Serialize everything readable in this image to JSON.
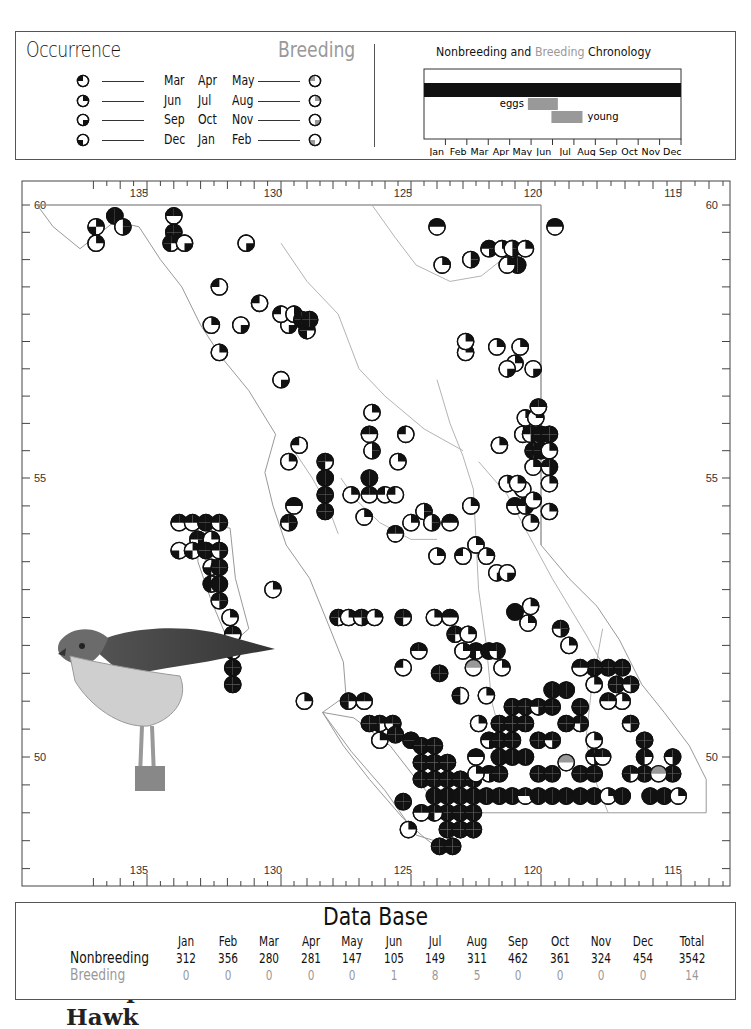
{
  "legend": {
    "occurrence_title": "Occurrence",
    "breeding_title": "Breeding",
    "seasons": [
      {
        "months": [
          "Mar",
          "Apr",
          "May"
        ],
        "quadrant": "top-left"
      },
      {
        "months": [
          "Jun",
          "Jul",
          "Aug"
        ],
        "quadrant": "top-right"
      },
      {
        "months": [
          "Sep",
          "Oct",
          "Nov"
        ],
        "quadrant": "bottom-right"
      },
      {
        "months": [
          "Dec",
          "Jan",
          "Feb"
        ],
        "quadrant": "bottom-left"
      }
    ],
    "colors": {
      "nonbreeding": "#111111",
      "breeding": "#999999"
    }
  },
  "chronology": {
    "title_a": "Nonbreeding",
    "title_and": "and",
    "title_b": "Breeding",
    "title_c": "Chronology",
    "months": [
      "Jan",
      "Feb",
      "Mar",
      "Apr",
      "May",
      "Jun",
      "Jul",
      "Aug",
      "Sep",
      "Oct",
      "Nov",
      "Dec"
    ],
    "bars": [
      {
        "label": "",
        "type": "nonbreeding",
        "start_month": 0,
        "end_month": 12
      },
      {
        "label": "eggs",
        "type": "breeding",
        "start_month": 4.85,
        "end_month": 6.25
      },
      {
        "label": "young",
        "type": "breeding",
        "start_month": 5.95,
        "end_month": 7.4
      }
    ]
  },
  "map": {
    "species_line1": "Sharp-shinned",
    "species_line2": "Hawk",
    "lon_labels": [
      "135",
      "130",
      "125",
      "120",
      "115"
    ],
    "lat_labels": [
      "60",
      "55",
      "50"
    ],
    "symbol_codes": "T=top-left(spring) R=top-right(summer) B=bottom-right(fall) L=bottom-left(winter) G=breeding gray",
    "records": [
      [
        136.2,
        59.8,
        "TRBL"
      ],
      [
        136.9,
        59.6,
        "RL"
      ],
      [
        135.9,
        59.6,
        "RB"
      ],
      [
        136.9,
        59.3,
        "R"
      ],
      [
        134.0,
        59.8,
        "TR"
      ],
      [
        134.0,
        59.5,
        "TRBL"
      ],
      [
        134.1,
        59.3,
        "TRL"
      ],
      [
        133.6,
        59.3,
        "B"
      ],
      [
        131.3,
        59.3,
        "B"
      ],
      [
        132.3,
        58.5,
        "T"
      ],
      [
        130.8,
        58.2,
        "T"
      ],
      [
        131.5,
        57.8,
        "B"
      ],
      [
        132.6,
        57.8,
        "R"
      ],
      [
        129.7,
        57.8,
        "B"
      ],
      [
        130.0,
        58.0,
        "T"
      ],
      [
        129.5,
        58.0,
        "RB"
      ],
      [
        129.2,
        57.9,
        "TRBL"
      ],
      [
        129.0,
        57.7,
        "TRL"
      ],
      [
        128.9,
        57.9,
        "TRBL"
      ],
      [
        132.3,
        57.3,
        "R"
      ],
      [
        130.0,
        56.8,
        "B"
      ],
      [
        126.5,
        56.2,
        "R"
      ],
      [
        126.6,
        55.8,
        "TR"
      ],
      [
        126.5,
        55.5,
        "RB"
      ],
      [
        125.5,
        55.3,
        "R"
      ],
      [
        125.2,
        55.8,
        "T"
      ],
      [
        129.3,
        55.6,
        "T"
      ],
      [
        129.7,
        55.3,
        "R"
      ],
      [
        128.3,
        55.3,
        "TRL"
      ],
      [
        128.3,
        55.0,
        "TRBL"
      ],
      [
        128.3,
        54.7,
        "TRBL"
      ],
      [
        128.3,
        54.4,
        "TRBL"
      ],
      [
        129.5,
        54.5,
        "TR"
      ],
      [
        129.7,
        54.2,
        "TRB"
      ],
      [
        126.6,
        55.0,
        "TRBL"
      ],
      [
        126.6,
        54.7,
        "TR"
      ],
      [
        126.0,
        54.7,
        "T"
      ],
      [
        125.6,
        54.7,
        "T"
      ],
      [
        127.3,
        54.7,
        "R"
      ],
      [
        126.8,
        54.3,
        "R"
      ],
      [
        125.0,
        54.2,
        "R"
      ],
      [
        125.6,
        54.0,
        "TR"
      ],
      [
        133.8,
        54.2,
        "TR"
      ],
      [
        133.3,
        54.2,
        "TR"
      ],
      [
        132.8,
        54.2,
        "TRBL"
      ],
      [
        132.3,
        54.2,
        "TRB"
      ],
      [
        133.1,
        53.9,
        "TRB"
      ],
      [
        132.6,
        53.9,
        "R"
      ],
      [
        133.8,
        53.7,
        "L"
      ],
      [
        133.3,
        53.7,
        "RL"
      ],
      [
        132.8,
        53.7,
        "TRBL"
      ],
      [
        132.3,
        53.7,
        "TRB"
      ],
      [
        132.6,
        53.4,
        "RL"
      ],
      [
        132.3,
        53.4,
        "TRBL"
      ],
      [
        132.6,
        53.1,
        "TL"
      ],
      [
        132.3,
        53.1,
        "TRBL"
      ],
      [
        132.3,
        52.8,
        "TRB"
      ],
      [
        131.9,
        52.5,
        "R"
      ],
      [
        131.8,
        52.2,
        "TR"
      ],
      [
        131.8,
        51.9,
        "TRL"
      ],
      [
        131.8,
        51.6,
        "TRBL"
      ],
      [
        131.8,
        51.3,
        "TRBL"
      ],
      [
        130.3,
        53.0,
        "R"
      ],
      [
        124.5,
        54.4,
        "RB"
      ],
      [
        124.2,
        54.2,
        "RB"
      ],
      [
        123.5,
        54.2,
        "TR"
      ],
      [
        124.0,
        53.6,
        "R"
      ],
      [
        123.0,
        53.6,
        "T"
      ],
      [
        122.5,
        53.8,
        "R"
      ],
      [
        122.1,
        53.6,
        "R"
      ],
      [
        121.7,
        53.3,
        "B"
      ],
      [
        121.3,
        53.3,
        "B"
      ],
      [
        122.7,
        54.5,
        "R"
      ],
      [
        121.0,
        54.5,
        "TR"
      ],
      [
        120.6,
        54.5,
        "TRB"
      ],
      [
        120.4,
        54.2,
        "R"
      ],
      [
        120.7,
        54.8,
        "T"
      ],
      [
        127.8,
        52.5,
        "TRL"
      ],
      [
        127.4,
        52.5,
        "R"
      ],
      [
        126.9,
        52.5,
        "TRB"
      ],
      [
        126.4,
        52.5,
        "R"
      ],
      [
        125.3,
        52.5,
        "TRL"
      ],
      [
        124.1,
        52.5,
        "R"
      ],
      [
        123.5,
        52.5,
        "TR"
      ],
      [
        123.3,
        52.2,
        "TRL"
      ],
      [
        122.8,
        52.2,
        "R"
      ],
      [
        122.5,
        51.9,
        "TRL"
      ],
      [
        123.0,
        51.9,
        "R"
      ],
      [
        122.0,
        51.9,
        "TRBL"
      ],
      [
        121.7,
        51.9,
        "TRB"
      ],
      [
        121.5,
        51.6,
        "R"
      ],
      [
        122.6,
        51.6,
        "G"
      ],
      [
        124.7,
        51.9,
        "TR"
      ],
      [
        123.9,
        51.5,
        "TRBL"
      ],
      [
        125.3,
        51.6,
        "T"
      ],
      [
        129.1,
        51.0,
        "R"
      ],
      [
        127.4,
        51.0,
        "TRL"
      ],
      [
        126.8,
        51.0,
        "TR"
      ],
      [
        126.2,
        50.6,
        "TRL"
      ],
      [
        126.6,
        50.6,
        "TRBL"
      ],
      [
        125.7,
        50.6,
        "TRB"
      ],
      [
        125.6,
        50.4,
        "TRBL"
      ],
      [
        126.2,
        50.3,
        "R"
      ],
      [
        125.0,
        50.3,
        "TRBL"
      ],
      [
        124.6,
        50.2,
        "TRBL"
      ],
      [
        124.1,
        50.2,
        "TRBL"
      ],
      [
        124.6,
        49.9,
        "TRBL"
      ],
      [
        124.1,
        49.9,
        "TRBL"
      ],
      [
        123.6,
        49.9,
        "TRBL"
      ],
      [
        124.6,
        49.6,
        "TRBL"
      ],
      [
        124.1,
        49.6,
        "TRBL"
      ],
      [
        123.6,
        49.6,
        "TRBL"
      ],
      [
        123.1,
        49.6,
        "TRBL"
      ],
      [
        122.6,
        49.6,
        "TRBL"
      ],
      [
        124.1,
        49.3,
        "TRBL"
      ],
      [
        123.6,
        49.3,
        "TRBL"
      ],
      [
        123.1,
        49.3,
        "TRBL"
      ],
      [
        122.6,
        49.3,
        "TRBL"
      ],
      [
        122.1,
        49.3,
        "TRBL"
      ],
      [
        121.6,
        49.3,
        "TRBL"
      ],
      [
        121.1,
        49.3,
        "TRBL"
      ],
      [
        120.6,
        49.3,
        "TR"
      ],
      [
        120.1,
        49.3,
        "TRBL"
      ],
      [
        119.6,
        49.3,
        "TRBL"
      ],
      [
        119.1,
        49.3,
        "TRBL"
      ],
      [
        118.6,
        49.3,
        "TRBL"
      ],
      [
        118.1,
        49.3,
        "TRBL"
      ],
      [
        117.6,
        49.3,
        "R"
      ],
      [
        117.1,
        49.3,
        "TRBL"
      ],
      [
        116.1,
        49.3,
        "TRBL"
      ],
      [
        115.6,
        49.3,
        "TRBL"
      ],
      [
        115.1,
        49.3,
        "R"
      ],
      [
        123.6,
        49.0,
        "TRBL"
      ],
      [
        123.1,
        49.0,
        "TRBL"
      ],
      [
        122.6,
        49.0,
        "TRBL"
      ],
      [
        124.1,
        49.0,
        "TRL"
      ],
      [
        124.6,
        49.0,
        "TR"
      ],
      [
        123.6,
        48.7,
        "TRBL"
      ],
      [
        123.1,
        48.7,
        "TRBL"
      ],
      [
        122.6,
        48.7,
        "TRBL"
      ],
      [
        123.9,
        48.4,
        "TRBL"
      ],
      [
        123.4,
        48.4,
        "TRBL"
      ],
      [
        125.1,
        48.7,
        "R"
      ],
      [
        125.3,
        49.2,
        "TRBL"
      ],
      [
        122.4,
        50.6,
        "R"
      ],
      [
        122.0,
        50.3,
        "TRB"
      ],
      [
        121.6,
        50.6,
        "TRBL"
      ],
      [
        121.6,
        50.3,
        "TRBL"
      ],
      [
        121.1,
        50.6,
        "TRBL"
      ],
      [
        121.1,
        50.9,
        "TRBL"
      ],
      [
        121.1,
        50.3,
        "TRBL"
      ],
      [
        120.6,
        50.6,
        "TRBL"
      ],
      [
        120.6,
        50.9,
        "TRBL"
      ],
      [
        120.1,
        50.9,
        "TRB"
      ],
      [
        119.6,
        51.2,
        "TRBL"
      ],
      [
        119.1,
        51.2,
        "TRBL"
      ],
      [
        119.6,
        50.9,
        "TRBL"
      ],
      [
        118.6,
        50.9,
        "TRBL"
      ],
      [
        118.6,
        50.6,
        "TRB"
      ],
      [
        119.1,
        50.6,
        "TRBL"
      ],
      [
        120.1,
        50.3,
        "TRBL"
      ],
      [
        119.6,
        50.3,
        "TRB"
      ],
      [
        118.1,
        50.3,
        "R"
      ],
      [
        121.6,
        50.0,
        "TRBL"
      ],
      [
        121.1,
        50.0,
        "TRBL"
      ],
      [
        120.6,
        50.0,
        "TRBL"
      ],
      [
        120.1,
        49.7,
        "TRBL"
      ],
      [
        119.6,
        49.7,
        "TRBL"
      ],
      [
        118.6,
        49.7,
        "TRBL"
      ],
      [
        122.5,
        50.0,
        "TR"
      ],
      [
        122.0,
        49.7,
        "TRB"
      ],
      [
        122.5,
        49.7,
        "R"
      ],
      [
        121.6,
        49.7,
        "TRBL"
      ],
      [
        118.1,
        49.7,
        "TRBL"
      ],
      [
        119.1,
        49.9,
        "G"
      ],
      [
        118.1,
        50.0,
        "TRB"
      ],
      [
        117.6,
        51.6,
        "TRBL"
      ],
      [
        117.1,
        51.6,
        "TRBL"
      ],
      [
        117.3,
        51.3,
        "TRBL"
      ],
      [
        116.8,
        51.3,
        "TRB"
      ],
      [
        117.1,
        51.0,
        "R"
      ],
      [
        116.8,
        50.6,
        "TRB"
      ],
      [
        116.3,
        50.3,
        "TRBL"
      ],
      [
        116.3,
        50.0,
        "TRL"
      ],
      [
        116.3,
        49.7,
        "TRBL"
      ],
      [
        116.8,
        49.7,
        "TRL"
      ],
      [
        115.3,
        50.0,
        "TRB"
      ],
      [
        115.3,
        49.7,
        "TRBL"
      ],
      [
        115.8,
        49.7,
        "G"
      ],
      [
        117.8,
        50.0,
        "TR"
      ],
      [
        118.1,
        51.6,
        "TRBL"
      ],
      [
        118.1,
        51.3,
        "R"
      ],
      [
        118.6,
        51.6,
        "TR"
      ],
      [
        117.6,
        51.0,
        "TR"
      ],
      [
        122.1,
        51.1,
        "R"
      ],
      [
        123.1,
        51.1,
        "TL"
      ],
      [
        119.3,
        52.3,
        "TRB"
      ],
      [
        119.0,
        52.0,
        "R"
      ],
      [
        121.0,
        52.6,
        "TRBL"
      ],
      [
        120.5,
        52.4,
        "R"
      ],
      [
        120.4,
        52.7,
        "R"
      ],
      [
        120.6,
        56.1,
        "R"
      ],
      [
        120.2,
        56.1,
        "R"
      ],
      [
        120.7,
        55.8,
        "R"
      ],
      [
        120.4,
        55.8,
        "TRB"
      ],
      [
        120.0,
        55.8,
        "TRBL"
      ],
      [
        119.7,
        55.8,
        "TRBL"
      ],
      [
        120.3,
        55.5,
        "TRBL"
      ],
      [
        120.0,
        55.5,
        "TRBL"
      ],
      [
        119.7,
        55.5,
        "R"
      ],
      [
        120.3,
        55.2,
        "R"
      ],
      [
        119.7,
        55.2,
        "TRB"
      ],
      [
        119.7,
        54.9,
        "R"
      ],
      [
        121.3,
        54.9,
        "R"
      ],
      [
        120.9,
        54.9,
        "R"
      ],
      [
        119.7,
        54.4,
        "R"
      ],
      [
        120.3,
        54.6,
        "R"
      ],
      [
        121.6,
        55.6,
        "R"
      ],
      [
        120.1,
        56.3,
        "TR"
      ],
      [
        121.0,
        57.1,
        "R"
      ],
      [
        120.8,
        57.4,
        "R"
      ],
      [
        121.3,
        57.0,
        "B"
      ],
      [
        120.3,
        57.0,
        "B"
      ],
      [
        122.9,
        57.3,
        "R"
      ],
      [
        121.7,
        57.4,
        "R"
      ],
      [
        122.9,
        57.5,
        "R"
      ],
      [
        122.0,
        59.2,
        "TRB"
      ],
      [
        121.5,
        59.2,
        "R"
      ],
      [
        121.1,
        59.2,
        "RB"
      ],
      [
        120.6,
        59.2,
        "R"
      ],
      [
        120.9,
        58.9,
        "TRBL"
      ],
      [
        121.3,
        58.9,
        "R"
      ],
      [
        119.5,
        59.6,
        "TR"
      ],
      [
        124.0,
        59.6,
        "TR"
      ],
      [
        123.8,
        58.9,
        "R"
      ],
      [
        122.7,
        59.0,
        "RB"
      ]
    ]
  },
  "database": {
    "title": "Data Base",
    "columns": [
      "Jan",
      "Feb",
      "Mar",
      "Apr",
      "May",
      "Jun",
      "Jul",
      "Aug",
      "Sep",
      "Oct",
      "Nov",
      "Dec",
      "Total"
    ],
    "rows": [
      {
        "label": "Nonbreeding",
        "values": [
          "312",
          "356",
          "280",
          "281",
          "147",
          "105",
          "149",
          "311",
          "462",
          "361",
          "324",
          "454",
          "3542"
        ]
      },
      {
        "label": "Breeding",
        "values": [
          "0",
          "0",
          "0",
          "0",
          "0",
          "1",
          "8",
          "5",
          "0",
          "0",
          "0",
          "0",
          "14"
        ]
      }
    ]
  }
}
